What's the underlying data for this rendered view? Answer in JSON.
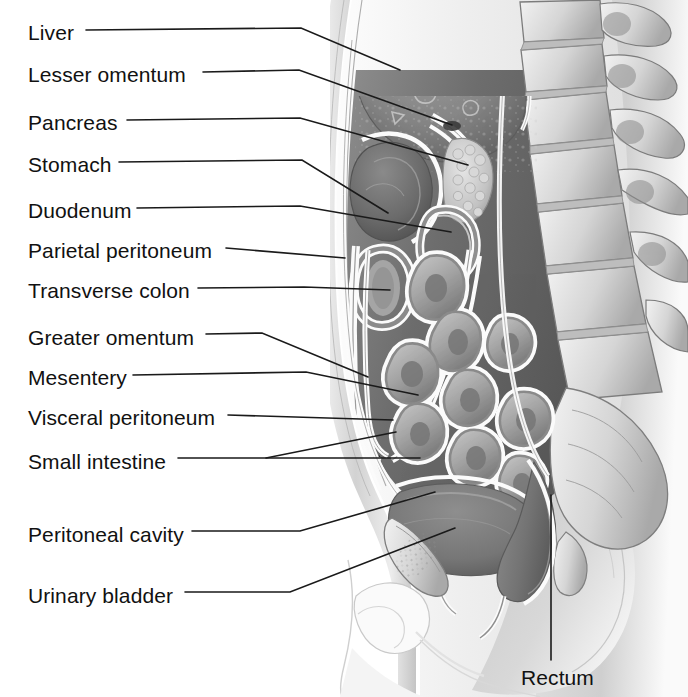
{
  "figure": {
    "kind": "anatomical-illustration",
    "style": "grayscale pencil/airbrush medical illustration",
    "palette": {
      "background": "#ffffff",
      "label_text": "#111111",
      "leader_line": "#1a1a1a",
      "liver": "#8a8a8a",
      "stomach": "#6f6f6f",
      "peritoneal_cavity": "#6b6b6b",
      "serosa_highlight": "#fbfbfb",
      "bone": "#d9d9d9",
      "bone_shadow": "#9a9a9a",
      "body_wall": "#e8e8e8",
      "soft_tissue": "#c9c9c9"
    }
  },
  "labels": [
    {
      "id": "liver",
      "text": "Liver",
      "x": 28,
      "y": 36,
      "line_start_x": 86,
      "anchor_x": 400,
      "anchor_y": 70
    },
    {
      "id": "lesser-omentum",
      "text": "Lesser omentum",
      "x": 28,
      "y": 78,
      "line_start_x": 203,
      "anchor_x": 452,
      "anchor_y": 125
    },
    {
      "id": "pancreas",
      "text": "Pancreas",
      "x": 28,
      "y": 126,
      "line_start_x": 127,
      "anchor_x": 468,
      "anchor_y": 165
    },
    {
      "id": "stomach",
      "text": "Stomach",
      "x": 28,
      "y": 168,
      "line_start_x": 119,
      "anchor_x": 388,
      "anchor_y": 213
    },
    {
      "id": "duodenum",
      "text": "Duodenum",
      "x": 28,
      "y": 214,
      "line_start_x": 137,
      "anchor_x": 451,
      "anchor_y": 232
    },
    {
      "id": "parietal-peritoneum",
      "text": "Parietal peritoneum",
      "x": 28,
      "y": 254,
      "line_start_x": 226,
      "anchor_x": 345,
      "anchor_y": 258
    },
    {
      "id": "transverse-colon",
      "text": "Transverse colon",
      "x": 28,
      "y": 294,
      "line_start_x": 198,
      "anchor_x": 390,
      "anchor_y": 290
    },
    {
      "id": "greater-omentum",
      "text": "Greater omentum",
      "x": 28,
      "y": 341,
      "line_start_x": 206,
      "anchor_x": 368,
      "anchor_y": 377
    },
    {
      "id": "mesentery",
      "text": "Mesentery",
      "x": 28,
      "y": 381,
      "line_start_x": 133,
      "anchor_x": 418,
      "anchor_y": 395
    },
    {
      "id": "visceral-peritoneum",
      "text": "Visceral peritoneum",
      "x": 28,
      "y": 421,
      "line_start_x": 228,
      "anchor_x": 393,
      "anchor_y": 420
    },
    {
      "id": "small-intestine",
      "text": "Small intestine",
      "x": 28,
      "y": 465,
      "line_start_x": 178,
      "anchor_x": 396,
      "anchor_y": 432,
      "anchor2_x": 420,
      "anchor2_y": 458
    },
    {
      "id": "peritoneal-cavity",
      "text": "Peritoneal cavity",
      "x": 28,
      "y": 538,
      "line_start_x": 192,
      "anchor_x": 435,
      "anchor_y": 492
    },
    {
      "id": "urinary-bladder",
      "text": "Urinary bladder",
      "x": 28,
      "y": 599,
      "line_start_x": 185,
      "anchor_x": 455,
      "anchor_y": 528
    },
    {
      "id": "rectum",
      "text": "Rectum",
      "x": 521,
      "y": 683,
      "line_start_x": 0,
      "anchor_x": 551,
      "anchor_y": 495
    }
  ],
  "structures": [
    {
      "id": "liver",
      "name": "Liver"
    },
    {
      "id": "lesser-omentum",
      "name": "Lesser omentum"
    },
    {
      "id": "pancreas",
      "name": "Pancreas"
    },
    {
      "id": "stomach",
      "name": "Stomach"
    },
    {
      "id": "duodenum",
      "name": "Duodenum"
    },
    {
      "id": "parietal-peritoneum",
      "name": "Parietal peritoneum"
    },
    {
      "id": "transverse-colon",
      "name": "Transverse colon"
    },
    {
      "id": "greater-omentum",
      "name": "Greater omentum"
    },
    {
      "id": "mesentery",
      "name": "Mesentery"
    },
    {
      "id": "visceral-peritoneum",
      "name": "Visceral peritoneum"
    },
    {
      "id": "small-intestine",
      "name": "Small intestine"
    },
    {
      "id": "peritoneal-cavity",
      "name": "Peritoneal cavity"
    },
    {
      "id": "urinary-bladder",
      "name": "Urinary bladder"
    },
    {
      "id": "rectum",
      "name": "Rectum"
    },
    {
      "id": "vertebral-column",
      "name": "Vertebral column"
    },
    {
      "id": "sacrum",
      "name": "Sacrum"
    },
    {
      "id": "pubic-bone",
      "name": "Pubic bone"
    },
    {
      "id": "abdominal-wall",
      "name": "Anterior abdominal wall"
    }
  ]
}
